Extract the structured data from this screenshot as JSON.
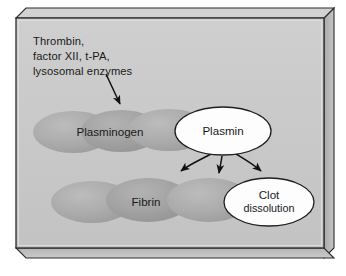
{
  "figure": {
    "panel_style": "3d-gray-slab"
  },
  "colors": {
    "page_background": "#ffffff",
    "panel_face": "#c9c9c9",
    "panel_border": "#2b2b2b",
    "panel_inner_highlight": "#d8d8d8",
    "slab_side": "#b4b4b4",
    "slab_bottom": "#bdbdbd",
    "ellipse_fill": "#b0b0b0",
    "ellipse_fill_dark": "#a3a3a3",
    "bubble_fill": "#fdfdfd",
    "bubble_stroke": "#1f1f1f",
    "arrow_color": "#111111",
    "text_color": "#1a1a1a"
  },
  "annotations": {
    "enzymes": {
      "name": "activating-enzymes",
      "lines": [
        "Thrombin,",
        "factor XII, t-PA,",
        "lysosomal enzymes"
      ]
    }
  },
  "substrates": {
    "plasminogen": {
      "label": "Plasminogen",
      "ellipse_count": 3
    },
    "fibrin": {
      "label": "Fibrin",
      "ellipse_count": 3
    }
  },
  "products": {
    "plasmin": {
      "label": "Plasmin"
    },
    "clot_dissolution": {
      "label_line1": "Clot",
      "label_line2": "dissolution"
    }
  },
  "arrows": [
    {
      "name": "enzymes-to-plasminogen",
      "from": "activating enzymes",
      "to": "Plasminogen",
      "style": "straight"
    },
    {
      "name": "plasmin-to-fibrin-left",
      "from": "Plasmin",
      "to": "Fibrin",
      "style": "curved"
    },
    {
      "name": "plasmin-to-fibrin-center",
      "from": "Plasmin",
      "to": "Fibrin",
      "style": "curved"
    },
    {
      "name": "plasmin-to-clot-dissolution",
      "from": "Plasmin",
      "to": "Clot dissolution",
      "style": "curved"
    }
  ]
}
